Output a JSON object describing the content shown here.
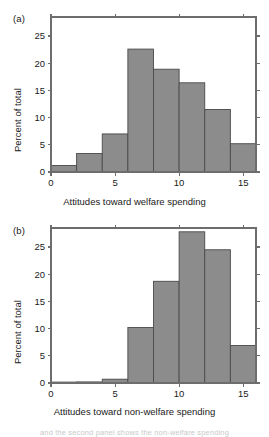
{
  "figure": {
    "background": "#ffffff",
    "bar_fill": "#8c8c8c",
    "bar_stroke": "#4a4a4a",
    "axis_color": "#6d6d6d",
    "footer_fragment": "and the second panel shows the non-welfare spending"
  },
  "panels": [
    {
      "tag": "(a)",
      "ylabel": "Percent of total",
      "xlabel": "Attitudes toward welfare spending",
      "xticks": [
        "0",
        "5",
        "10",
        "15"
      ],
      "yticks": [
        "0",
        "5",
        "10",
        "15",
        "20",
        "25"
      ]
    },
    {
      "tag": "(b)",
      "ylabel": "Percent of total",
      "xlabel": "Attitudes toward non-welfare spending",
      "xticks": [
        "0",
        "5",
        "10",
        "15"
      ],
      "yticks": [
        "0",
        "5",
        "10",
        "15",
        "20",
        "25"
      ]
    }
  ],
  "chart_data": [
    {
      "type": "bar",
      "title": "(a)",
      "xlabel": "Attitudes toward welfare spending",
      "ylabel": "Percent of total",
      "bin_edges": [
        0,
        2,
        4,
        6,
        8,
        10,
        12,
        14,
        16
      ],
      "categories": [
        "0-2",
        "2-4",
        "4-6",
        "6-8",
        "8-10",
        "10-12",
        "12-14",
        "14-16"
      ],
      "values": [
        1.2,
        3.4,
        7.0,
        22.6,
        18.9,
        16.4,
        11.5,
        5.2
      ],
      "xlim": [
        0,
        16
      ],
      "ylim": [
        0,
        28.5
      ],
      "xticks": [
        0,
        5,
        10,
        15
      ],
      "yticks": [
        0,
        5,
        10,
        15,
        20,
        25
      ],
      "grid": false,
      "legend": "none"
    },
    {
      "type": "bar",
      "title": "(b)",
      "xlabel": "Attitudes toward non-welfare spending",
      "ylabel": "Percent of total",
      "bin_edges": [
        0,
        2,
        4,
        6,
        8,
        10,
        12,
        14,
        16
      ],
      "categories": [
        "0-2",
        "2-4",
        "4-6",
        "6-8",
        "8-10",
        "10-12",
        "12-14",
        "14-16"
      ],
      "values": [
        0.1,
        0.2,
        0.7,
        10.2,
        18.7,
        27.8,
        24.5,
        6.9
      ],
      "xlim": [
        0,
        16
      ],
      "ylim": [
        0,
        28.5
      ],
      "xticks": [
        0,
        5,
        10,
        15
      ],
      "yticks": [
        0,
        5,
        10,
        15,
        20,
        25
      ],
      "grid": false,
      "legend": "none"
    }
  ]
}
